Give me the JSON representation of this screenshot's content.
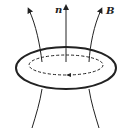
{
  "diagram": {
    "labels": {
      "normal": "n",
      "field": "B"
    },
    "colors": {
      "stroke": "#222222",
      "background": "#ffffff"
    }
  }
}
